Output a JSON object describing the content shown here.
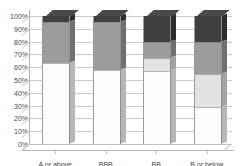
{
  "chart_data": {
    "type": "bar",
    "subtype": "100% stacked column (3D)",
    "title": "",
    "title_clipped": true,
    "xlabel": "",
    "ylabel": "",
    "categories": [
      "A or above",
      "BBB",
      "BB",
      "B or below"
    ],
    "ylim": [
      0,
      100
    ],
    "ytick_labels": [
      "0%",
      "10%",
      "20%",
      "30%",
      "40%",
      "50%",
      "60%",
      "70%",
      "80%",
      "90%",
      "100%"
    ],
    "ytick_values": [
      0,
      10,
      20,
      30,
      40,
      50,
      60,
      70,
      80,
      90,
      100
    ],
    "grid": true,
    "legend": "none",
    "series": [
      {
        "name": "Series 1",
        "color": "#fdfdfd",
        "values": [
          63,
          58,
          57,
          29
        ]
      },
      {
        "name": "Series 2",
        "color": "#e2e2e2",
        "values": [
          0,
          0,
          10,
          26
        ]
      },
      {
        "name": "Series 3",
        "color": "#9c9c9c",
        "values": [
          32,
          37,
          13,
          25
        ]
      },
      {
        "name": "Series 4",
        "color": "#3f3f3f",
        "values": [
          5,
          5,
          20,
          20
        ]
      }
    ],
    "units": "percent"
  },
  "axis": {
    "y_labels": [
      "100%",
      "90%",
      "80%",
      "70%",
      "60%",
      "50%",
      "40%",
      "30%",
      "20%",
      "10%",
      "0%"
    ],
    "x_labels": [
      "A or above",
      "BBB",
      "BB",
      "B or below"
    ]
  },
  "colors": {
    "series_1": "#fdfdfd",
    "series_2": "#e2e2e2",
    "series_3": "#9c9c9c",
    "series_4": "#3f3f3f",
    "gridline": "#c9c9c9",
    "axis": "#b0b0b0",
    "text": "#4a4a4a",
    "background": "#ffffff"
  }
}
